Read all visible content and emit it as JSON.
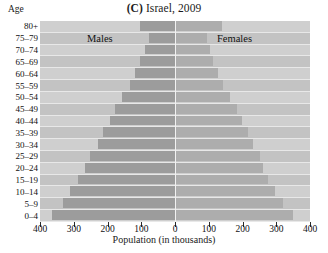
{
  "chart_data": {
    "type": "bar",
    "orientation": "population-pyramid",
    "title": "(C) Israel, 2009",
    "panel_letter": "(C)",
    "title_rest": "Israel, 2009",
    "xlabel": "Population (in thousands)",
    "ylabel": "Age",
    "xlim": [
      -400,
      400
    ],
    "xticks": [
      400,
      300,
      200,
      100,
      0,
      100,
      200,
      300,
      400
    ],
    "grid": false,
    "legend_position": "inside-top",
    "series_labels": {
      "left": "Males",
      "right": "Females"
    },
    "categories": [
      "80+",
      "75–79",
      "70–74",
      "65–69",
      "60–64",
      "55–59",
      "50–54",
      "45–49",
      "40–44",
      "35–39",
      "30–34",
      "25–29",
      "20–24",
      "15–19",
      "10–14",
      "5–9",
      "0–4"
    ],
    "series": [
      {
        "name": "Males",
        "color": "#9c9c9c",
        "values": [
          104,
          77,
          90,
          103,
          119,
          134,
          158,
          178,
          193,
          213,
          228,
          252,
          267,
          287,
          311,
          332,
          364
        ]
      },
      {
        "name": "Females",
        "color": "#adadad",
        "values": [
          140,
          95,
          103,
          113,
          128,
          143,
          164,
          184,
          198,
          217,
          231,
          252,
          261,
          276,
          297,
          320,
          350
        ]
      }
    ],
    "axis_max": 400,
    "colors": {
      "plot_background": "#c9c9c9",
      "row_band_light": "#cfcfcf",
      "row_band_dark": "#c3c3c3",
      "male_bar": "#9c9c9c",
      "female_bar": "#adadad",
      "center_line": "#f2f2f2",
      "tick": "#2b2b2b",
      "text": "#111111"
    }
  }
}
